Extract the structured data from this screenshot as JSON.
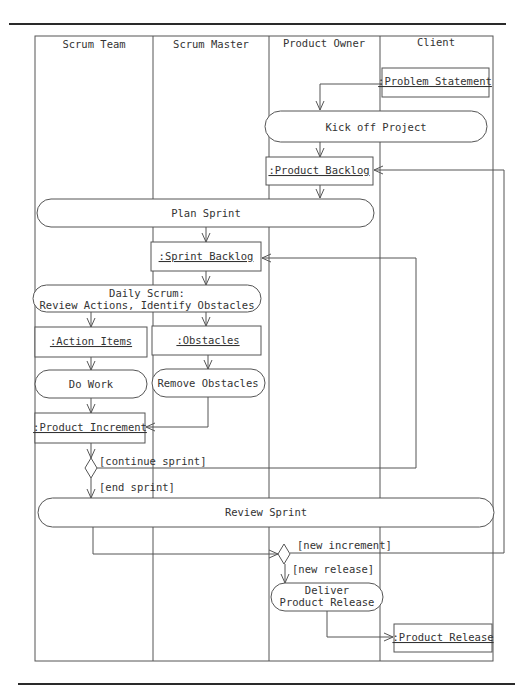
{
  "diagram": {
    "type": "uml-activity-diagram",
    "lanes": [
      {
        "label": "Scrum Team"
      },
      {
        "label": "Scrum Master"
      },
      {
        "label": "Product Owner"
      },
      {
        "label": "Client"
      }
    ],
    "objects": {
      "problem_statement": ":Problem Statement",
      "product_backlog": ":Product Backlog",
      "sprint_backlog": ":Sprint Backlog",
      "action_items": ":Action Items",
      "obstacles": ":Obstacles",
      "product_increment": ":Product Increment",
      "product_release": ":Product Release"
    },
    "activities": {
      "kick_off": "Kick off Project",
      "plan_sprint": "Plan Sprint",
      "daily_scrum_line1": "Daily Scrum:",
      "daily_scrum_line2": "Review Actions, Identify Obstacles",
      "do_work": "Do Work",
      "remove_obstacles": "Remove Obstacles",
      "review_sprint": "Review Sprint",
      "deliver_line1": "Deliver",
      "deliver_line2": "Product Release"
    },
    "guards": {
      "continue_sprint": "[continue sprint]",
      "end_sprint": "[end sprint]",
      "new_increment": "[new increment]",
      "new_release": "[new release]"
    }
  }
}
